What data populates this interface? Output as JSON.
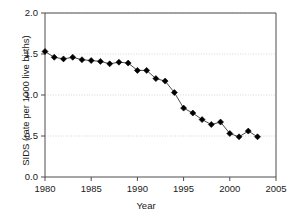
{
  "chart_data": {
    "type": "line",
    "title": "",
    "subtitle": "",
    "xlabel": "Year",
    "ylabel": "SIDS (rate per 1000 live births)",
    "xlim": [
      1980,
      2005
    ],
    "ylim": [
      0.0,
      2.0
    ],
    "xticks": [
      1980,
      1985,
      1990,
      1995,
      2000,
      2005
    ],
    "xticklabels": [
      "1980",
      "1985",
      "1990",
      "1995",
      "2000",
      "2005"
    ],
    "yticks": [
      0.0,
      0.5,
      1.0,
      1.5,
      2.0
    ],
    "yticklabels": [
      "0.0",
      "0.5",
      "1.0",
      "1.5",
      "2.0"
    ],
    "grid": "horizontal-dotted",
    "legend": "none",
    "marker": "filled-diamond",
    "marker_color": "#000000",
    "line_color": "#4d4d4d",
    "x": [
      1980,
      1981,
      1982,
      1983,
      1984,
      1985,
      1986,
      1987,
      1988,
      1989,
      1990,
      1991,
      1992,
      1993,
      1994,
      1995,
      1996,
      1997,
      1998,
      1999,
      2000,
      2001,
      2002,
      2003
    ],
    "values": [
      1.53,
      1.46,
      1.44,
      1.46,
      1.43,
      1.42,
      1.41,
      1.38,
      1.4,
      1.39,
      1.3,
      1.3,
      1.2,
      1.17,
      1.03,
      0.84,
      0.78,
      0.7,
      0.64,
      0.67,
      0.53,
      0.49,
      0.56,
      0.49
    ],
    "series": [
      {
        "name": "SIDS rate",
        "values": [
          1.53,
          1.46,
          1.44,
          1.46,
          1.43,
          1.42,
          1.41,
          1.38,
          1.4,
          1.39,
          1.3,
          1.3,
          1.2,
          1.17,
          1.03,
          0.84,
          0.78,
          0.7,
          0.64,
          0.67,
          0.53,
          0.49,
          0.56,
          0.49
        ]
      }
    ]
  },
  "axis_colors": {
    "axis": "#4d4d4d",
    "grid": "#cccccc",
    "text": "#1a1a1a"
  }
}
